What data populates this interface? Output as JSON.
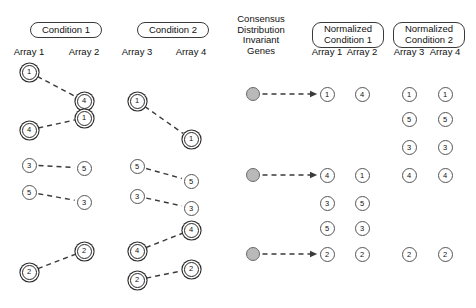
{
  "figure": {
    "width": 476,
    "height": 308,
    "background": "#ffffff",
    "node_fill": "#ffffff",
    "node_stroke": "#555555",
    "consensus_fill": "#b9b9b9",
    "link_color": "#3a3a3a"
  },
  "headers": {
    "condition_1": "Condition 1",
    "condition_2": "Condition 2",
    "consensus": "Consensus\nDistribution\nInvariant\nGenes",
    "consensus_lines": [
      "Consensus",
      "Distribution",
      "Invariant",
      "Genes"
    ],
    "normalized_condition_1_line1": "Normalized",
    "normalized_condition_1_line2": "Condition 1",
    "normalized_condition_2_line1": "Normalized",
    "normalized_condition_2_line2": "Condition 2"
  },
  "columns": {
    "raw": [
      {
        "key": "array1",
        "label": "Array 1",
        "x": 29
      },
      {
        "key": "array2",
        "label": "Array 2",
        "x": 84
      },
      {
        "key": "array3",
        "label": "Array 3",
        "x": 137
      },
      {
        "key": "array4",
        "label": "Array 4",
        "x": 191
      }
    ],
    "normalized": [
      {
        "key": "narray1",
        "label": "Array 1",
        "x": 327
      },
      {
        "key": "narray2",
        "label": "Array 2",
        "x": 362
      },
      {
        "key": "narray3",
        "label": "Array 3",
        "x": 409
      },
      {
        "key": "narray4",
        "label": "Array 4",
        "x": 445
      }
    ]
  },
  "chart_data": {
    "type": "diagram",
    "nodes": {
      "array1": [
        {
          "label": "1",
          "x": 29,
          "y": 72,
          "invariant": true
        },
        {
          "label": "4",
          "x": 29,
          "y": 130,
          "invariant": true
        },
        {
          "label": "3",
          "x": 29,
          "y": 165,
          "invariant": false
        },
        {
          "label": "5",
          "x": 29,
          "y": 192,
          "invariant": false
        },
        {
          "label": "2",
          "x": 29,
          "y": 272,
          "invariant": true
        }
      ],
      "array2": [
        {
          "label": "4",
          "x": 84,
          "y": 101,
          "invariant": true
        },
        {
          "label": "1",
          "x": 84,
          "y": 118,
          "invariant": true
        },
        {
          "label": "5",
          "x": 84,
          "y": 168,
          "invariant": false
        },
        {
          "label": "3",
          "x": 84,
          "y": 202,
          "invariant": false
        },
        {
          "label": "2",
          "x": 84,
          "y": 251,
          "invariant": true
        }
      ],
      "array3": [
        {
          "label": "1",
          "x": 137,
          "y": 101,
          "invariant": true
        },
        {
          "label": "5",
          "x": 137,
          "y": 166,
          "invariant": false
        },
        {
          "label": "3",
          "x": 137,
          "y": 196,
          "invariant": false
        },
        {
          "label": "4",
          "x": 137,
          "y": 251,
          "invariant": true
        },
        {
          "label": "2",
          "x": 137,
          "y": 280,
          "invariant": true
        }
      ],
      "array4": [
        {
          "label": "1",
          "x": 191,
          "y": 139,
          "invariant": true
        },
        {
          "label": "5",
          "x": 191,
          "y": 181,
          "invariant": false
        },
        {
          "label": "3",
          "x": 191,
          "y": 208,
          "invariant": false
        },
        {
          "label": "4",
          "x": 191,
          "y": 230,
          "invariant": true
        },
        {
          "label": "2",
          "x": 191,
          "y": 269,
          "invariant": true
        }
      ],
      "consensus": [
        {
          "label": "",
          "x": 253,
          "y": 94
        },
        {
          "label": "",
          "x": 253,
          "y": 175
        },
        {
          "label": "",
          "x": 253,
          "y": 254
        }
      ],
      "narray1": [
        {
          "label": "1",
          "x": 327,
          "y": 94
        },
        {
          "label": "4",
          "x": 327,
          "y": 175
        },
        {
          "label": "3",
          "x": 327,
          "y": 203
        },
        {
          "label": "5",
          "x": 327,
          "y": 228
        },
        {
          "label": "2",
          "x": 327,
          "y": 254
        }
      ],
      "narray2": [
        {
          "label": "4",
          "x": 362,
          "y": 94
        },
        {
          "label": "1",
          "x": 362,
          "y": 175
        },
        {
          "label": "5",
          "x": 362,
          "y": 203
        },
        {
          "label": "3",
          "x": 362,
          "y": 228
        },
        {
          "label": "2",
          "x": 362,
          "y": 254
        }
      ],
      "narray3": [
        {
          "label": "1",
          "x": 409,
          "y": 94
        },
        {
          "label": "5",
          "x": 409,
          "y": 119
        },
        {
          "label": "3",
          "x": 409,
          "y": 147
        },
        {
          "label": "4",
          "x": 409,
          "y": 175
        },
        {
          "label": "2",
          "x": 409,
          "y": 254
        }
      ],
      "narray4": [
        {
          "label": "1",
          "x": 445,
          "y": 94
        },
        {
          "label": "5",
          "x": 445,
          "y": 119
        },
        {
          "label": "3",
          "x": 445,
          "y": 147
        },
        {
          "label": "4",
          "x": 445,
          "y": 175
        },
        {
          "label": "2",
          "x": 445,
          "y": 254
        }
      ]
    },
    "links": [
      {
        "from": [
          29,
          72
        ],
        "to": [
          84,
          101
        ],
        "arrow": false
      },
      {
        "from": [
          29,
          130
        ],
        "to": [
          84,
          118
        ],
        "arrow": false
      },
      {
        "from": [
          29,
          165
        ],
        "to": [
          84,
          168
        ],
        "arrow": false
      },
      {
        "from": [
          29,
          192
        ],
        "to": [
          84,
          202
        ],
        "arrow": false
      },
      {
        "from": [
          29,
          272
        ],
        "to": [
          84,
          251
        ],
        "arrow": false
      },
      {
        "from": [
          137,
          101
        ],
        "to": [
          191,
          139
        ],
        "arrow": false
      },
      {
        "from": [
          137,
          166
        ],
        "to": [
          191,
          181
        ],
        "arrow": false
      },
      {
        "from": [
          137,
          196
        ],
        "to": [
          191,
          208
        ],
        "arrow": false
      },
      {
        "from": [
          137,
          251
        ],
        "to": [
          191,
          230
        ],
        "arrow": false
      },
      {
        "from": [
          137,
          280
        ],
        "to": [
          191,
          269
        ],
        "arrow": false
      },
      {
        "from": [
          253,
          94
        ],
        "to": [
          327,
          94
        ],
        "arrow": true
      },
      {
        "from": [
          253,
          175
        ],
        "to": [
          327,
          175
        ],
        "arrow": true
      },
      {
        "from": [
          253,
          254
        ],
        "to": [
          327,
          254
        ],
        "arrow": true
      }
    ]
  }
}
